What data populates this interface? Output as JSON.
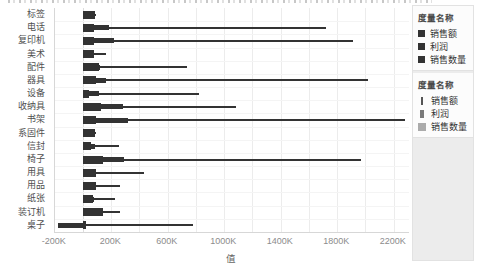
{
  "window": {
    "width": 478,
    "height": 269
  },
  "colors": {
    "mark": "#333333",
    "grid": "#ececec",
    "panel_bg": "#ececec"
  },
  "axis": {
    "x_title": "值"
  },
  "legends": {
    "color": {
      "title": "度量名称",
      "items": [
        {
          "label": "销售额"
        },
        {
          "label": "利润"
        },
        {
          "label": "销售数量"
        }
      ]
    },
    "size": {
      "title": "度量名称",
      "items": [
        {
          "label": "销售额",
          "size": "small"
        },
        {
          "label": "利润",
          "size": "medium"
        },
        {
          "label": "销售数量",
          "size": "large"
        }
      ]
    }
  },
  "chart_data": {
    "type": "bar",
    "orientation": "horizontal",
    "title": "",
    "xlabel": "值",
    "units": "K (thousands), values estimated from axis",
    "xlim": [
      -198,
      2308
    ],
    "grid_step": 200,
    "grid": "vertical gridlines every 200K",
    "legend_position": "right",
    "x_ticks": [
      {
        "label": "-200K",
        "value": -200
      },
      {
        "label": "200K",
        "value": 200
      },
      {
        "label": "600K",
        "value": 600
      },
      {
        "label": "1000K",
        "value": 1000
      },
      {
        "label": "1400K",
        "value": 1400
      },
      {
        "label": "1800K",
        "value": 1800
      },
      {
        "label": "2200K",
        "value": 2200
      }
    ],
    "categories": [
      "标签",
      "电话",
      "复印机",
      "美术",
      "配件",
      "器具",
      "设备",
      "收纳具",
      "书架",
      "系固件",
      "信封",
      "椅子",
      "用具",
      "用品",
      "纸张",
      "装订机",
      "桌子"
    ],
    "series": [
      {
        "name": "销售额",
        "size_role": "small",
        "values": [
          90,
          1720,
          1910,
          160,
          740,
          2015,
          820,
          1080,
          2280,
          90,
          255,
          1970,
          430,
          260,
          230,
          260,
          780
        ]
      },
      {
        "name": "利润",
        "size_role": "medium",
        "values": [
          55,
          185,
          220,
          40,
          120,
          165,
          110,
          280,
          320,
          30,
          85,
          290,
          95,
          75,
          80,
          110,
          -175
        ]
      },
      {
        "name": "销售数量",
        "size_role": "large",
        "values": [
          85,
          80,
          75,
          80,
          115,
          90,
          45,
          125,
          95,
          85,
          55,
          140,
          90,
          90,
          70,
          140,
          20
        ]
      }
    ]
  }
}
